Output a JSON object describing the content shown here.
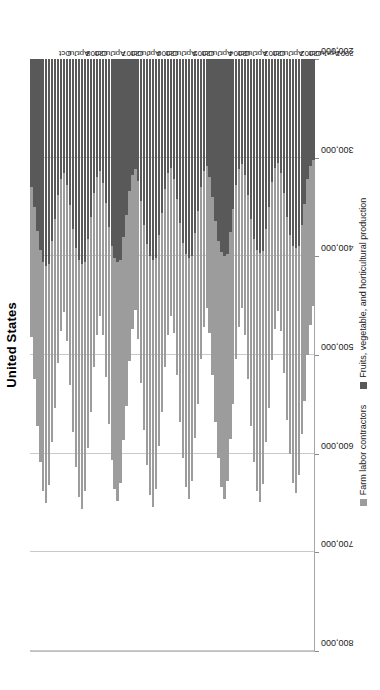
{
  "chart_title": "United States",
  "legend": {
    "items": [
      {
        "label": "Farm labor contractors",
        "color": "#9c9c9c",
        "key": "farm_labor_contractors"
      },
      {
        "label": "Fruits, vegetable, and horticultural production",
        "color": "#595959",
        "key": "fruits_vegetable_horticultural"
      }
    ]
  },
  "axis": {
    "x_ticks": [
      "200,000",
      "300,000",
      "400,000",
      "500,000",
      "600,000",
      "700,000",
      "800,000"
    ],
    "x_min": 200000,
    "x_max": 800000,
    "reversed": true,
    "gridlines": true
  },
  "chart_data": {
    "type": "bar",
    "orientation": "horizontal-stacked",
    "rotated_degrees": -90,
    "title": "United States",
    "xlabel": "",
    "ylabel": "",
    "xlim": [
      200000,
      800000
    ],
    "x_reversed": true,
    "grid": true,
    "legend_position": "bottom",
    "tick_labels": [
      "200,000",
      "300,000",
      "400,000",
      "500,000",
      "600,000",
      "700,000",
      "800,000"
    ],
    "categories": [
      "2001",
      "Feb",
      "Mar",
      "Apr",
      "May",
      "Jun",
      "Jul",
      "Aug",
      "Sep",
      "Oct",
      "Nov",
      "Dec",
      "2002",
      "Feb",
      "Mar",
      "Apr",
      "May",
      "Jun",
      "Jul",
      "Aug",
      "Sep",
      "Oct",
      "Nov",
      "Dec",
      "2003",
      "Feb",
      "Mar",
      "Apr",
      "May",
      "Jun",
      "Jul",
      "Aug",
      "Sep",
      "Oct",
      "Nov",
      "Dec",
      "2004",
      "Feb",
      "Mar",
      "Apr",
      "May",
      "Jun",
      "Jul",
      "Aug",
      "Sep",
      "Oct",
      "Nov",
      "Dec",
      "2005",
      "Feb",
      "Mar",
      "Apr",
      "May",
      "Jun",
      "Jul",
      "Aug",
      "Sep",
      "Oct",
      "Nov",
      "Dec",
      "2006",
      "Feb",
      "Mar",
      "Apr",
      "May",
      "Jun",
      "Jul",
      "Aug",
      "Sep",
      "Oct",
      "Nov",
      "Dec",
      "2007",
      "Feb",
      "Mar",
      "Apr",
      "May",
      "Jun",
      "Jul",
      "Aug",
      "Sep",
      "Oct",
      "Nov",
      "Dec",
      "2008",
      "Feb",
      "Mar",
      "Apr",
      "May",
      "Jun",
      "Jul",
      "Aug",
      "Sep",
      "Oct",
      "Nov",
      "Dec"
    ],
    "visible_category_labels": [
      "2001",
      "Apr",
      "Jul",
      "Oct",
      "2002",
      "Apr",
      "Jul",
      "Oct",
      "2003",
      "Apr",
      "Jul",
      "Oct",
      "2004",
      "Apr",
      "Jul",
      "Oct",
      "2005",
      "Apr",
      "Jul",
      "Oct",
      "2006",
      "Apr",
      "Jul",
      "Oct",
      "2007",
      "Apr",
      "Jul",
      "Oct",
      "2008",
      "Apr",
      "Jul",
      "Oct"
    ],
    "series": [
      {
        "name": "Fruits, vegetable, and horticultural production",
        "color": "#595959",
        "values": [
          302000,
          308000,
          322000,
          347000,
          368000,
          390000,
          392000,
          390000,
          378000,
          360000,
          336000,
          316000,
          305000,
          310000,
          325000,
          350000,
          372000,
          395000,
          397000,
          394000,
          382000,
          362000,
          338000,
          318000,
          306000,
          312000,
          328000,
          352000,
          375000,
          398000,
          400000,
          396000,
          384000,
          364000,
          340000,
          320000,
          308000,
          314000,
          330000,
          354000,
          376000,
          400000,
          402000,
          398000,
          386000,
          366000,
          342000,
          322000,
          310000,
          316000,
          332000,
          356000,
          378000,
          402000,
          404000,
          400000,
          388000,
          368000,
          344000,
          324000,
          312000,
          318000,
          334000,
          358000,
          380000,
          404000,
          406000,
          402000,
          390000,
          370000,
          346000,
          326000,
          314000,
          320000,
          336000,
          360000,
          382000,
          406000,
          408000,
          404000,
          392000,
          372000,
          348000,
          328000,
          316000,
          322000,
          338000,
          362000,
          384000,
          408000,
          410000,
          406000,
          394000,
          374000,
          350000,
          330000
        ]
      },
      {
        "name": "Farm labor contractors",
        "color": "#9c9c9c",
        "values": [
          148000,
          162000,
          178000,
          200000,
          212000,
          232000,
          248000,
          240000,
          222000,
          206000,
          182000,
          160000,
          150000,
          164000,
          180000,
          204000,
          216000,
          236000,
          252000,
          244000,
          226000,
          210000,
          186000,
          162000,
          146000,
          160000,
          176000,
          198000,
          210000,
          230000,
          246000,
          238000,
          220000,
          204000,
          180000,
          158000,
          144000,
          158000,
          174000,
          196000,
          208000,
          228000,
          244000,
          236000,
          218000,
          202000,
          178000,
          156000,
          150000,
          164000,
          180000,
          202000,
          214000,
          234000,
          250000,
          242000,
          224000,
          208000,
          184000,
          160000,
          142000,
          156000,
          172000,
          194000,
          206000,
          226000,
          242000,
          234000,
          216000,
          200000,
          176000,
          154000,
          146000,
          160000,
          176000,
          198000,
          212000,
          232000,
          248000,
          240000,
          222000,
          206000,
          182000,
          158000,
          140000,
          154000,
          170000,
          192000,
          204000,
          224000,
          240000,
          232000,
          214000,
          198000,
          174000,
          152000
        ]
      }
    ]
  }
}
